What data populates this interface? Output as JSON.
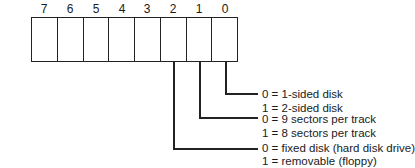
{
  "bits": [
    "7",
    "6",
    "5",
    "4",
    "3",
    "2",
    "1",
    "0"
  ],
  "legend": [
    {
      "bit": "0",
      "lines": [
        "0 = 1-sided disk",
        "1 = 2-sided disk"
      ]
    },
    {
      "bit": "1",
      "lines": [
        "0 = 9 sectors per track",
        "1 = 8 sectors per track"
      ]
    },
    {
      "bit": "2",
      "lines": [
        "0 = fixed disk (hard disk drive)",
        "1 = removable (floppy)"
      ]
    }
  ]
}
